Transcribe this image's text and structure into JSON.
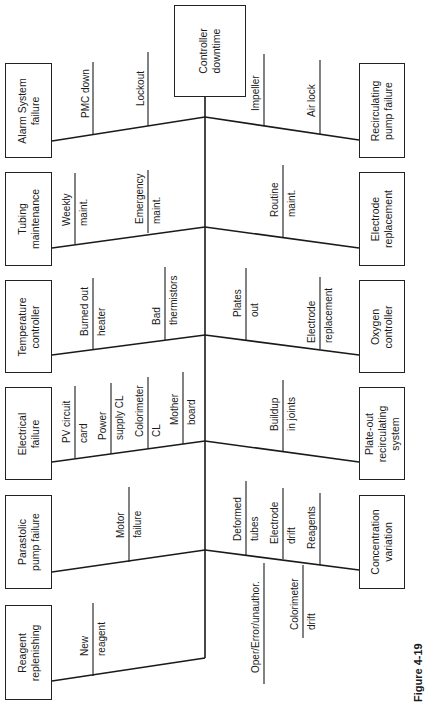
{
  "effect": {
    "line1": "Controller",
    "line2": "downtime"
  },
  "figure_label": "Figure 4-19",
  "left_causes": [
    {
      "title1": "Alarm System",
      "title2": "failure",
      "subs": [
        {
          "l1": "PMC down",
          "l2": ""
        },
        {
          "l1": "Lockout",
          "l2": ""
        }
      ]
    },
    {
      "title1": "Tubing",
      "title2": "maintenance",
      "subs": [
        {
          "l1": "Weekly",
          "l2": "maint."
        },
        {
          "l1": "Emergency",
          "l2": "maint."
        }
      ]
    },
    {
      "title1": "Temperature",
      "title2": "controller",
      "subs": [
        {
          "l1": "Burned out",
          "l2": "heater"
        },
        {
          "l1": "Bad",
          "l2": "thermistors"
        }
      ]
    },
    {
      "title1": "Electrical",
      "title2": "failure",
      "subs": [
        {
          "l1": "PV circuit",
          "l2": "card"
        },
        {
          "l1": "Power",
          "l2": "supply CL"
        },
        {
          "l1": "Colorimeter",
          "l2": "CL"
        },
        {
          "l1": "Mother",
          "l2": "board"
        }
      ]
    },
    {
      "title1": "Parastolic",
      "title2": "pump failure",
      "subs": [
        {
          "l1": "Motor",
          "l2": "failure"
        }
      ]
    },
    {
      "title1": "Reagent",
      "title2": "replenishing",
      "subs": [
        {
          "l1": "New",
          "l2": "reagent"
        }
      ]
    }
  ],
  "right_causes": [
    {
      "title1": "Recirculating",
      "title2": "pump failure",
      "subs": [
        {
          "l1": "Impeller",
          "l2": ""
        },
        {
          "l1": "Air lock",
          "l2": ""
        }
      ]
    },
    {
      "title1": "Electrode",
      "title2": "replacement",
      "subs": [
        {
          "l1": "Routine",
          "l2": "maint."
        }
      ]
    },
    {
      "title1": "Oxygen",
      "title2": "controller",
      "subs": [
        {
          "l1": "Plates",
          "l2": "out"
        },
        {
          "l1": "Electrode",
          "l2": "replacement"
        }
      ]
    },
    {
      "title1": "Plate-out",
      "title2": "recirculating",
      "title3": "system",
      "subs": [
        {
          "l1": "Buildup",
          "l2": "in joints"
        }
      ]
    },
    {
      "title1": "Concentration",
      "title2": "variation",
      "subs": [
        {
          "l1": "Deformed",
          "l2": "tubes"
        },
        {
          "l1": "Electrode",
          "l2": "drift"
        },
        {
          "l1": "Reagents",
          "l2": ""
        },
        {
          "l1": "Oper/Error/unauthor.",
          "l2": ""
        },
        {
          "l1": "Colorimeter",
          "l2": "drift"
        }
      ]
    }
  ]
}
